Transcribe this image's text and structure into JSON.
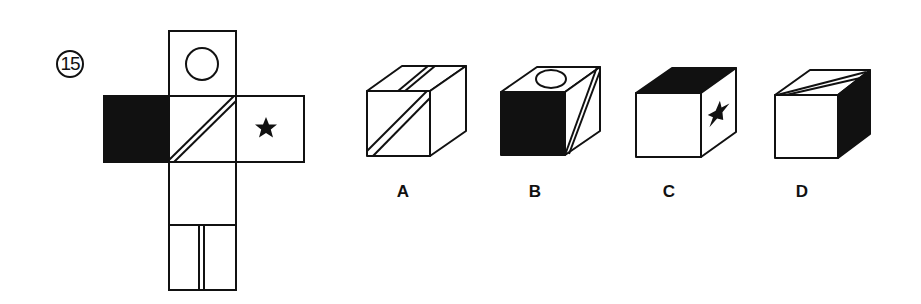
{
  "question": {
    "number": "15",
    "type": "cube-net-folding",
    "net": {
      "faces": [
        {
          "position": "top",
          "marking": "circle"
        },
        {
          "position": "left",
          "marking": "solid-black"
        },
        {
          "position": "center",
          "marking": "double-diagonal-line"
        },
        {
          "position": "right",
          "marking": "star"
        },
        {
          "position": "below-center",
          "marking": "blank"
        },
        {
          "position": "bottom",
          "marking": "double-vertical-line"
        }
      ]
    },
    "options": [
      {
        "label": "A",
        "front": "double-diagonal-line",
        "top": "double-line",
        "right": "blank"
      },
      {
        "label": "B",
        "front": "solid-black",
        "top": "circle",
        "right": "double-diagonal-line"
      },
      {
        "label": "C",
        "front": "blank",
        "top": "solid-black",
        "right": "star"
      },
      {
        "label": "D",
        "front": "blank",
        "top": "double-diagonal-line",
        "right": "solid-black"
      }
    ]
  },
  "colors": {
    "ink": "#111111",
    "paper": "#ffffff"
  }
}
